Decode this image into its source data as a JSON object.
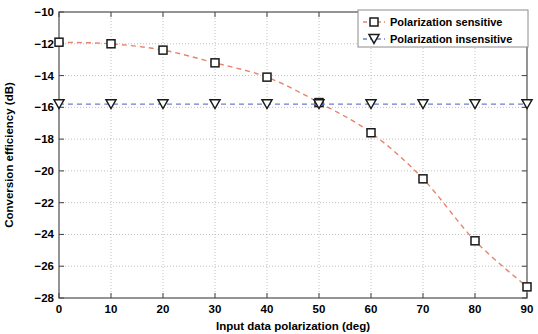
{
  "chart_data": {
    "type": "line",
    "title": "",
    "xlabel": "Input data polarization (deg)",
    "ylabel": "Conversion efficiency (dB)",
    "x": [
      0,
      10,
      20,
      30,
      40,
      50,
      60,
      70,
      80,
      90
    ],
    "xlim": [
      0,
      90
    ],
    "ylim": [
      -28,
      -10
    ],
    "xticks": [
      "0",
      "10",
      "20",
      "30",
      "40",
      "50",
      "60",
      "70",
      "80",
      "90"
    ],
    "yticks": [
      "-10",
      "-12",
      "-14",
      "-16",
      "-18",
      "-20",
      "-22",
      "-24",
      "-26",
      "-28"
    ],
    "xtick_values": [
      0,
      10,
      20,
      30,
      40,
      50,
      60,
      70,
      80,
      90
    ],
    "ytick_values": [
      -10,
      -12,
      -14,
      -16,
      -18,
      -20,
      -22,
      -24,
      -26,
      -28
    ],
    "grid": true,
    "legend_position": "top-right",
    "series": [
      {
        "name": "Polarization sensitive",
        "marker": "square",
        "linestyle": "dashed",
        "color": "#e8826a",
        "marker_edge_color": "#1a1a1a",
        "values": [
          -11.9,
          -12.0,
          -12.4,
          -13.2,
          -14.1,
          -15.7,
          -17.6,
          -20.5,
          -24.4,
          -27.3
        ]
      },
      {
        "name": "Polarization insensitive",
        "marker": "triangle-down",
        "linestyle": "dashed",
        "color": "#6a7fd0",
        "marker_edge_color": "#1a1a1a",
        "values": [
          -15.8,
          -15.8,
          -15.8,
          -15.8,
          -15.8,
          -15.8,
          -15.8,
          -15.8,
          -15.8,
          -15.8
        ]
      }
    ]
  },
  "legend": {
    "entries": [
      {
        "label": "Polarization sensitive"
      },
      {
        "label": "Polarization insensitive"
      }
    ]
  },
  "axes": {
    "x_title": "Input data polarization (deg)",
    "y_title": "Conversion efficiency (dB)"
  }
}
